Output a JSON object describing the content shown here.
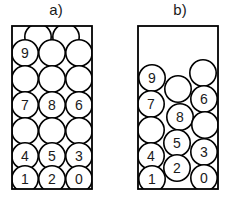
{
  "figure": {
    "type": "diagram",
    "stroke_color": "#000000",
    "fill_color": "#ffffff",
    "text_color": "#1a1a1a",
    "canvas": {
      "width": 227,
      "height": 206
    }
  },
  "panels": [
    {
      "id": "a",
      "label": "a)",
      "label_x": 56,
      "label_y": 12,
      "container": {
        "x": 12,
        "y": 26,
        "width": 80,
        "height": 163
      },
      "circle_radius": 13.2,
      "circles": [
        {
          "cx": 38,
          "cy": 37,
          "label": ""
        },
        {
          "cx": 66,
          "cy": 37,
          "label": ""
        },
        {
          "cx": 25,
          "cy": 53,
          "label": "9"
        },
        {
          "cx": 52,
          "cy": 53,
          "label": ""
        },
        {
          "cx": 79,
          "cy": 53,
          "label": ""
        },
        {
          "cx": 25,
          "cy": 79,
          "label": ""
        },
        {
          "cx": 52,
          "cy": 79,
          "label": ""
        },
        {
          "cx": 79,
          "cy": 79,
          "label": ""
        },
        {
          "cx": 25,
          "cy": 105,
          "label": "7"
        },
        {
          "cx": 52,
          "cy": 105,
          "label": "8"
        },
        {
          "cx": 79,
          "cy": 105,
          "label": "6"
        },
        {
          "cx": 25,
          "cy": 131,
          "label": ""
        },
        {
          "cx": 52,
          "cy": 131,
          "label": ""
        },
        {
          "cx": 79,
          "cy": 131,
          "label": ""
        },
        {
          "cx": 25,
          "cy": 156,
          "label": "4"
        },
        {
          "cx": 52,
          "cy": 156,
          "label": "5"
        },
        {
          "cx": 79,
          "cy": 156,
          "label": "3"
        },
        {
          "cx": 25,
          "cy": 179,
          "label": "1"
        },
        {
          "cx": 52,
          "cy": 179,
          "label": "2"
        },
        {
          "cx": 79,
          "cy": 179,
          "label": "0"
        }
      ]
    },
    {
      "id": "b",
      "label": "b)",
      "label_x": 180,
      "label_y": 12,
      "container": {
        "x": 138,
        "y": 26,
        "width": 80,
        "height": 163
      },
      "circle_radius": 13.2,
      "circles": [
        {
          "cx": 152,
          "cy": 78,
          "label": "9"
        },
        {
          "cx": 203,
          "cy": 73,
          "label": ""
        },
        {
          "cx": 178,
          "cy": 89,
          "label": ""
        },
        {
          "cx": 151,
          "cy": 104,
          "label": "7"
        },
        {
          "cx": 204,
          "cy": 99,
          "label": "6"
        },
        {
          "cx": 180,
          "cy": 117,
          "label": "8"
        },
        {
          "cx": 151,
          "cy": 130,
          "label": ""
        },
        {
          "cx": 205,
          "cy": 125,
          "label": ""
        },
        {
          "cx": 177,
          "cy": 143,
          "label": "5"
        },
        {
          "cx": 151,
          "cy": 156,
          "label": "4"
        },
        {
          "cx": 204,
          "cy": 152,
          "label": "3"
        },
        {
          "cx": 177,
          "cy": 168,
          "label": "2"
        },
        {
          "cx": 152,
          "cy": 179,
          "label": "1"
        },
        {
          "cx": 204,
          "cy": 178,
          "label": "0"
        }
      ]
    }
  ]
}
